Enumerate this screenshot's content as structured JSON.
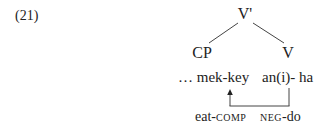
{
  "example": {
    "number": "(21)"
  },
  "tree": {
    "root": {
      "label": "V'"
    },
    "children": [
      {
        "label": "CP"
      },
      {
        "label": "V"
      }
    ]
  },
  "words": {
    "left": "… mek-key",
    "right": "an(i)- ha"
  },
  "glosses": {
    "left": {
      "stem": "eat-",
      "category": "COMP"
    },
    "right": {
      "category": "NEG",
      "stem": "-do"
    }
  },
  "arrow": {
    "from": "an(i)- ha",
    "to": "mek-key",
    "icon": "arrow-up-icon"
  },
  "colors": {
    "text": "#222222",
    "background": "#ffffff"
  }
}
